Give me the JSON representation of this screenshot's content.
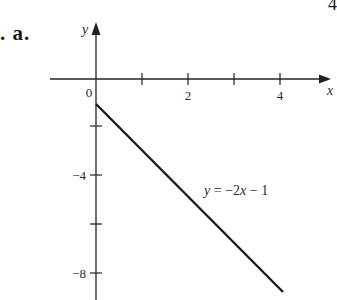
{
  "problem": {
    "label": ". a.",
    "corner_glyph": "4"
  },
  "axes": {
    "x_name": "y",
    "y_name": "x",
    "x_axis_label": "x",
    "y_axis_label": "y",
    "origin_label": "0",
    "x_tick_labels": [
      "2",
      "4"
    ],
    "y_tick_labels": [
      "−4",
      "−8"
    ]
  },
  "line": {
    "equation_label": "y = −2x − 1",
    "color": "#1a1a1a"
  },
  "chart_data": {
    "type": "line",
    "title": "",
    "xlabel": "x",
    "ylabel": "y",
    "xlim": [
      -2,
      5
    ],
    "ylim": [
      -9,
      3
    ],
    "x_ticks": [
      1,
      2,
      3,
      4
    ],
    "x_tick_labels": [
      "",
      "2",
      "",
      "4"
    ],
    "y_ticks": [
      -2,
      -4,
      -6,
      -8
    ],
    "y_tick_labels": [
      "",
      "-4",
      "",
      "-8"
    ],
    "grid": false,
    "legend": null,
    "series": [
      {
        "name": "y = -2x - 1",
        "x": [
          0,
          1,
          2,
          3,
          4
        ],
        "values": [
          -1,
          -3,
          -5,
          -7,
          -9
        ]
      }
    ],
    "annotations": [
      {
        "text": "y = -2x - 1",
        "x": 2.4,
        "y": -4.7
      },
      {
        "text": "0",
        "x": -0.1,
        "y": 0
      }
    ]
  }
}
